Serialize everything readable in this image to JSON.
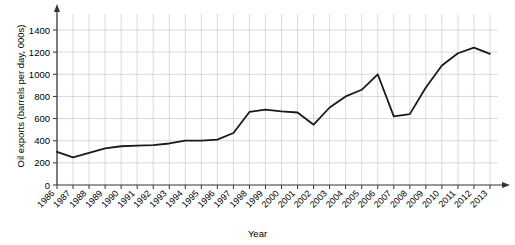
{
  "chart_data": {
    "type": "line",
    "title": "",
    "xlabel": "Year",
    "ylabel": "Oil exports (barrels per day, 000s)",
    "xlim": [
      1986,
      2013
    ],
    "ylim": [
      0,
      1450
    ],
    "yticks": [
      0,
      200,
      400,
      600,
      800,
      1000,
      1200,
      1400
    ],
    "ytick_labels": [
      "0",
      "200",
      "400",
      "600",
      "800",
      "1000",
      "1200",
      "1400"
    ],
    "grid": true,
    "legend": "none",
    "line_color": "#1a1a1a",
    "grid_color": "#c8c8c8",
    "axis_color": "#333333",
    "background": "#ffffff",
    "categories": [
      "1986",
      "1987",
      "1988",
      "1989",
      "1990",
      "1991",
      "1992",
      "1993",
      "1994",
      "1995",
      "1996",
      "1997",
      "1998",
      "1999",
      "2000",
      "2001",
      "2002",
      "2003",
      "2004",
      "2005",
      "2006",
      "2007",
      "2008",
      "2009",
      "2010",
      "2011",
      "2012",
      "2013"
    ],
    "x": [
      1986,
      1987,
      1988,
      1989,
      1990,
      1991,
      1992,
      1993,
      1994,
      1995,
      1996,
      1997,
      1998,
      1999,
      2000,
      2001,
      2002,
      2003,
      2004,
      2005,
      2006,
      2007,
      2008,
      2009,
      2010,
      2011,
      2012,
      2013
    ],
    "values": [
      300,
      250,
      290,
      330,
      350,
      355,
      360,
      375,
      400,
      400,
      410,
      470,
      660,
      680,
      665,
      655,
      545,
      700,
      800,
      860,
      1000,
      620,
      640,
      880,
      1080,
      1190,
      1240,
      1185
    ]
  }
}
